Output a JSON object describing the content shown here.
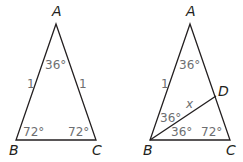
{
  "figures": [
    {
      "id": "left-triangle",
      "vertices": [
        {
          "name": "A",
          "x": 56,
          "y": 24,
          "label_x": 52,
          "label_y": 16
        },
        {
          "name": "B",
          "x": 16,
          "y": 140,
          "label_x": 9,
          "label_y": 155
        },
        {
          "name": "C",
          "x": 96,
          "y": 140,
          "label_x": 92,
          "label_y": 155
        }
      ],
      "angles": [
        {
          "label": "36°",
          "x": 45,
          "y": 69
        },
        {
          "label": "72°",
          "x": 23,
          "y": 136
        },
        {
          "label": "72°",
          "x": 68,
          "y": 136
        }
      ],
      "sides": [
        {
          "label": "1",
          "x": 27,
          "y": 88
        },
        {
          "label": "1",
          "x": 79,
          "y": 88
        }
      ]
    },
    {
      "id": "right-triangle",
      "vertices": [
        {
          "name": "A",
          "x": 190,
          "y": 24,
          "label_x": 186,
          "label_y": 16
        },
        {
          "name": "B",
          "x": 150,
          "y": 140,
          "label_x": 143,
          "label_y": 155
        },
        {
          "name": "C",
          "x": 230,
          "y": 140,
          "label_x": 226,
          "label_y": 155
        },
        {
          "name": "D",
          "x": 216,
          "y": 96,
          "label_x": 218,
          "label_y": 96
        }
      ],
      "angles": [
        {
          "label": "36°",
          "x": 179,
          "y": 69
        },
        {
          "label": "36°",
          "x": 160,
          "y": 122
        },
        {
          "label": "36°",
          "x": 171,
          "y": 136
        },
        {
          "label": "72°",
          "x": 201,
          "y": 136
        }
      ],
      "sides": [
        {
          "label": "1",
          "x": 161,
          "y": 88
        }
      ],
      "segment_label": {
        "label": "x",
        "x": 186,
        "y": 108
      }
    }
  ]
}
